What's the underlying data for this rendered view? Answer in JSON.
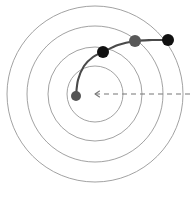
{
  "figure": {
    "name": "spiral-trajectory-diagram",
    "background_color": "#ffffff",
    "width": 192,
    "height": 200
  },
  "chart_data": {
    "type": "scatter",
    "title": "",
    "subtitle": "",
    "xlabel": "",
    "ylabel": "",
    "grid": "polar-concentric-circles",
    "legend": "none",
    "center": {
      "x": 95,
      "y": 94,
      "label": ""
    },
    "orbit_circles": [
      {
        "index": 1,
        "radius": 28,
        "color": "#8a8a8a"
      },
      {
        "index": 2,
        "radius": 47,
        "color": "#8a8a8a"
      },
      {
        "index": 3,
        "radius": 68,
        "color": "#8a8a8a"
      },
      {
        "index": 4,
        "radius": 88,
        "color": "#8a8a8a"
      }
    ],
    "reference_line": {
      "from_x": 95,
      "from_y": 94,
      "to_x": 192,
      "to_y": 94,
      "style": "dashed",
      "color": "#777777",
      "arrowhead": "left"
    },
    "trajectory": {
      "color": "#4a4a4a",
      "path_points": [
        {
          "x": 76,
          "y": 96
        },
        {
          "x": 78,
          "y": 80
        },
        {
          "x": 84,
          "y": 66
        },
        {
          "x": 93,
          "y": 57
        },
        {
          "x": 103,
          "y": 52
        },
        {
          "x": 118,
          "y": 45
        },
        {
          "x": 135,
          "y": 41
        },
        {
          "x": 152,
          "y": 40
        },
        {
          "x": 168,
          "y": 40
        }
      ]
    },
    "points": [
      {
        "id": "p0",
        "x": 76,
        "y": 96,
        "radius": 5.0,
        "color": "#555555",
        "label": ""
      },
      {
        "id": "p1",
        "x": 103,
        "y": 52,
        "radius": 6.0,
        "color": "#111111",
        "label": ""
      },
      {
        "id": "p2",
        "x": 135,
        "y": 41,
        "radius": 6.0,
        "color": "#585858",
        "label": ""
      },
      {
        "id": "p3",
        "x": 168,
        "y": 40,
        "radius": 6.0,
        "color": "#111111",
        "label": ""
      }
    ]
  }
}
